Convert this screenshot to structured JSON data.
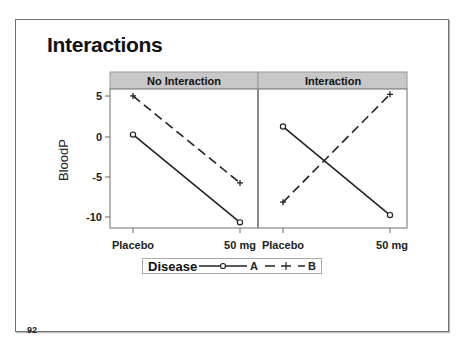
{
  "slide": {
    "title": "Interactions",
    "page_number": "92"
  },
  "chart_data": {
    "type": "line",
    "title": "Interactions",
    "xlabel": "",
    "ylabel": "BloodP",
    "ylim": [
      -11,
      6
    ],
    "yticks": [
      5,
      0,
      -5,
      -10
    ],
    "categories": [
      "Placebo",
      "50 mg"
    ],
    "grid": false,
    "legend_position": "bottom",
    "legend_title": "Disease",
    "panels": [
      {
        "name": "No Interaction",
        "series": [
          {
            "name": "A",
            "line": "solid",
            "marker": "circle",
            "values": [
              0.3,
              -10.6
            ]
          },
          {
            "name": "B",
            "line": "dashed",
            "marker": "plus",
            "values": [
              5.1,
              -5.7
            ]
          }
        ]
      },
      {
        "name": "Interaction",
        "series": [
          {
            "name": "A",
            "line": "solid",
            "marker": "circle",
            "values": [
              1.3,
              -9.7
            ]
          },
          {
            "name": "B",
            "line": "dashed",
            "marker": "plus",
            "values": [
              -8.1,
              5.3
            ]
          }
        ]
      }
    ]
  },
  "legend": {
    "title": "Disease",
    "items": [
      {
        "label": "A"
      },
      {
        "label": "B"
      }
    ]
  },
  "axis": {
    "y_label": "BloodP",
    "y_ticks": [
      "5",
      "0",
      "-5",
      "-10"
    ],
    "x_ticks": [
      "Placebo",
      "50 mg",
      "Placebo",
      "50 mg"
    ]
  },
  "panels": {
    "left_title": "No Interaction",
    "right_title": "Interaction"
  },
  "colors": {
    "strip": "#c8c8c8",
    "frame": "#888888",
    "line": "#222222"
  }
}
